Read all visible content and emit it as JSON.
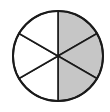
{
  "diagram": {
    "type": "fraction-circle",
    "total_parts": 6,
    "shaded_parts": 3,
    "shaded_side": "right",
    "colors": {
      "shaded": "#c6c6c6",
      "unshaded": "#ffffff",
      "stroke": "#1a1a1a"
    }
  }
}
